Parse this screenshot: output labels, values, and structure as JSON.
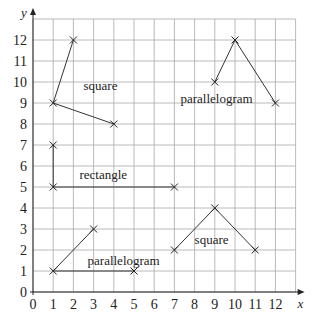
{
  "axes": {
    "x_label": "x",
    "y_label": "y",
    "x_ticks": [
      "0",
      "1",
      "2",
      "3",
      "4",
      "5",
      "6",
      "7",
      "8",
      "9",
      "10",
      "11",
      "12"
    ],
    "y_ticks": [
      "0",
      "1",
      "2",
      "3",
      "4",
      "5",
      "6",
      "7",
      "8",
      "9",
      "10",
      "11",
      "12"
    ],
    "x_range": [
      0,
      13
    ],
    "y_range": [
      0,
      13
    ]
  },
  "shapes": [
    {
      "label": "square",
      "points": [
        [
          2,
          12
        ],
        [
          1,
          9
        ],
        [
          4,
          8
        ]
      ],
      "label_pos": [
        2.5,
        9.6
      ]
    },
    {
      "label": "parallelogram",
      "points": [
        [
          9,
          10
        ],
        [
          10,
          12
        ],
        [
          12,
          9
        ]
      ],
      "label_pos": [
        7.3,
        9.0
      ]
    },
    {
      "label": "rectangle",
      "points": [
        [
          1,
          7
        ],
        [
          1,
          5
        ],
        [
          7,
          5
        ]
      ],
      "label_pos": [
        2.3,
        5.4
      ]
    },
    {
      "label": "parallelogram",
      "points": [
        [
          3,
          3
        ],
        [
          1,
          1
        ],
        [
          5,
          1
        ]
      ],
      "label_pos": [
        2.7,
        1.3
      ]
    },
    {
      "label": "square",
      "points": [
        [
          7,
          2
        ],
        [
          9,
          4
        ],
        [
          11,
          2
        ]
      ],
      "label_pos": [
        8.0,
        2.3
      ]
    }
  ],
  "chart_data": {
    "type": "scatter",
    "title": "",
    "xlabel": "x",
    "ylabel": "y",
    "xlim": [
      0,
      13
    ],
    "ylim": [
      0,
      13
    ],
    "grid": true,
    "series": [
      {
        "name": "square",
        "x": [
          2,
          1,
          4
        ],
        "y": [
          12,
          9,
          8
        ]
      },
      {
        "name": "parallelogram",
        "x": [
          9,
          10,
          12
        ],
        "y": [
          10,
          12,
          9
        ]
      },
      {
        "name": "rectangle",
        "x": [
          1,
          1,
          7
        ],
        "y": [
          7,
          5,
          5
        ]
      },
      {
        "name": "parallelogram",
        "x": [
          3,
          1,
          5
        ],
        "y": [
          3,
          1,
          1
        ]
      },
      {
        "name": "square",
        "x": [
          7,
          9,
          11
        ],
        "y": [
          2,
          4,
          2
        ]
      }
    ]
  }
}
